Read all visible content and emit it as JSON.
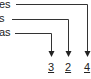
{
  "labels": [
    {
      "text": "es",
      "target": "4"
    },
    {
      "text": "s",
      "target": "2"
    },
    {
      "text": "as",
      "target": "3"
    }
  ],
  "numbers": [
    "3",
    "2",
    "4"
  ],
  "colors": {
    "line": "#333333",
    "text": "#222222"
  }
}
